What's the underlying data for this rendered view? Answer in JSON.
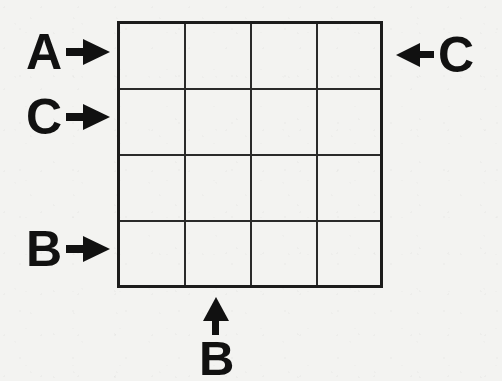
{
  "figure": {
    "type": "grid-diagram",
    "background_color": "#f3f3f1",
    "line_color": "#1b1b1b",
    "text_color": "#111111"
  },
  "grid": {
    "rows": 4,
    "columns": 4,
    "cells_empty": true,
    "border_color": "#1b1b1b",
    "interior_line_color": "#2a2a2a"
  },
  "labels": {
    "left": [
      {
        "letter": "A",
        "arrow": "arrow-right-icon",
        "row": 1
      },
      {
        "letter": "C",
        "arrow": "arrow-right-icon",
        "row": 2
      },
      {
        "letter": "B",
        "arrow": "arrow-right-icon",
        "row": 4
      }
    ],
    "right": [
      {
        "letter": "C",
        "arrow": "arrow-left-icon",
        "row": 1
      }
    ],
    "bottom": [
      {
        "letter": "B",
        "arrow": "arrow-up-icon",
        "column": 2
      }
    ]
  },
  "chart_data": {
    "type": "table",
    "title": "",
    "categories": [
      "col1",
      "col2",
      "col3",
      "col4"
    ],
    "row_labels": [
      "A",
      "C",
      "",
      "B"
    ],
    "column_labels": [
      "",
      "B",
      "",
      ""
    ],
    "right_labels": [
      "C",
      "",
      "",
      ""
    ],
    "values": [
      [
        "",
        "",
        "",
        ""
      ],
      [
        "",
        "",
        "",
        ""
      ],
      [
        "",
        "",
        "",
        ""
      ],
      [
        "",
        "",
        "",
        ""
      ]
    ],
    "grid": true,
    "legend": "none"
  }
}
